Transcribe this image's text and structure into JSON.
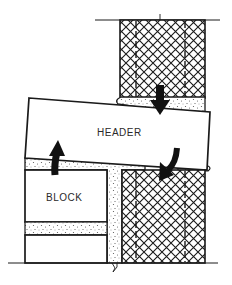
{
  "diagram": {
    "type": "masonry-section",
    "labels": {
      "header": "HEADER",
      "block": "BLOCK"
    },
    "colors": {
      "ink": "#1a1a1a",
      "paper": "#ffffff",
      "mortar_dots": "#555555"
    },
    "components": [
      {
        "name": "upper-brick-wall",
        "fill": "crosshatch"
      },
      {
        "name": "header",
        "fill": "blank"
      },
      {
        "name": "concrete-block",
        "fill": "blank"
      },
      {
        "name": "lower-brick-wall",
        "fill": "crosshatch"
      },
      {
        "name": "mortar",
        "fill": "stipple"
      }
    ],
    "arrows": [
      {
        "name": "down-arrow",
        "direction": "down"
      },
      {
        "name": "up-arrow",
        "direction": "up"
      },
      {
        "name": "curved-down-arrow",
        "direction": "down-left"
      }
    ]
  }
}
